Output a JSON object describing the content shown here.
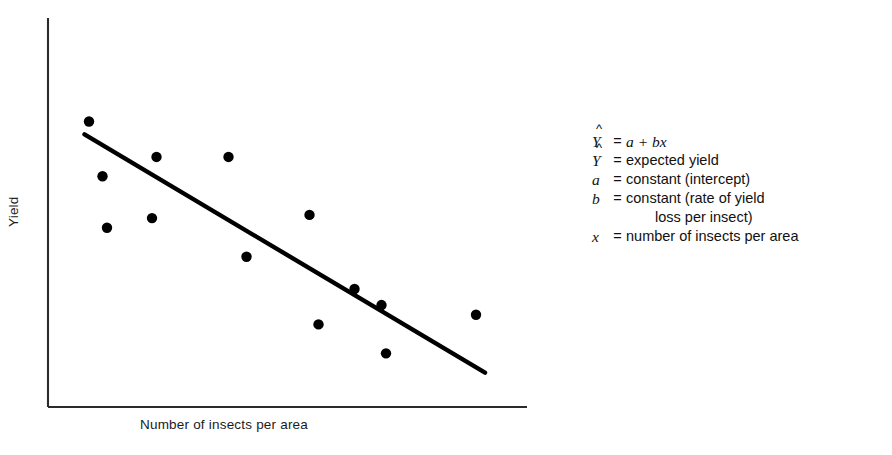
{
  "figure": {
    "background": "#ffffff",
    "ink": "#000000"
  },
  "axes": {
    "ylabel": "Yield",
    "xlabel": "Number of insects per area"
  },
  "legend": {
    "rows": [
      {
        "symbol": "Y",
        "hat": "^",
        "eq": "=",
        "desc_pre": "",
        "desc_italic": "a + bx",
        "desc_post": "",
        "continuation": false
      },
      {
        "symbol": "Y",
        "hat": "^",
        "eq": "=",
        "desc_pre": "expected yield",
        "desc_italic": "",
        "desc_post": "",
        "continuation": false
      },
      {
        "symbol": "a",
        "hat": "",
        "eq": "=",
        "desc_pre": "constant (intercept)",
        "desc_italic": "",
        "desc_post": "",
        "continuation": false
      },
      {
        "symbol": "b",
        "hat": "",
        "eq": "=",
        "desc_pre": "constant (rate of yield",
        "desc_italic": "",
        "desc_post": "",
        "continuation": false
      },
      {
        "symbol": "",
        "hat": "",
        "eq": "",
        "desc_pre": "loss per insect)",
        "desc_italic": "",
        "desc_post": "",
        "continuation": true
      },
      {
        "symbol": "x",
        "hat": "",
        "eq": "=",
        "desc_pre": "number of insects per area",
        "desc_italic": "",
        "desc_post": "",
        "continuation": false
      }
    ]
  },
  "chart_data": {
    "type": "scatter",
    "title": "",
    "xlabel": "Number of insects per area",
    "ylabel": "Yield",
    "grid": false,
    "legend_position": "right",
    "axis_style": "open-lower-left-corner",
    "xlim": [
      0,
      100
    ],
    "ylim": [
      0,
      100
    ],
    "tick_labels": {
      "x": [],
      "y": []
    },
    "series": [
      {
        "name": "observations",
        "type": "scatter",
        "marker": "filled-circle",
        "color": "#000000",
        "points": [
          {
            "x": 6,
            "y": 84
          },
          {
            "x": 21,
            "y": 73
          },
          {
            "x": 9,
            "y": 67
          },
          {
            "x": 37,
            "y": 73
          },
          {
            "x": 20,
            "y": 54
          },
          {
            "x": 10,
            "y": 51
          },
          {
            "x": 55,
            "y": 55
          },
          {
            "x": 41,
            "y": 42
          },
          {
            "x": 65,
            "y": 32
          },
          {
            "x": 71,
            "y": 27
          },
          {
            "x": 57,
            "y": 21
          },
          {
            "x": 92,
            "y": 24
          },
          {
            "x": 72,
            "y": 12
          }
        ]
      },
      {
        "name": "fitted regression line",
        "type": "line",
        "color": "#000000",
        "equation": "Y-hat = a + bx",
        "endpoints": [
          {
            "x": 5,
            "y": 80
          },
          {
            "x": 94,
            "y": 6
          }
        ]
      }
    ]
  }
}
